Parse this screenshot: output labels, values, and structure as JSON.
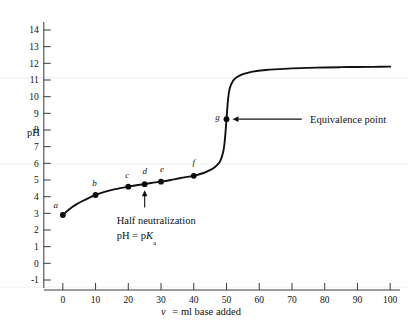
{
  "chart_data": {
    "type": "line",
    "title": "",
    "xlabel": "v = ml base added",
    "ylabel": "pH",
    "xlim": [
      -3,
      103
    ],
    "ylim": [
      -1.6,
      14.6
    ],
    "grid": false,
    "legend_position": "none",
    "x_ticks": [
      0,
      10,
      20,
      30,
      40,
      50,
      60,
      70,
      80,
      90,
      100
    ],
    "y_ticks": [
      -1,
      0,
      1,
      2,
      3,
      4,
      5,
      6,
      7,
      8,
      9,
      10,
      11,
      12,
      13,
      14
    ],
    "x_tick_labels": [
      "0",
      "10",
      "20",
      "30",
      "40",
      "50",
      "60",
      "70",
      "80",
      "90",
      "100"
    ],
    "y_tick_labels": [
      "-1",
      "0",
      "1",
      "2",
      "3",
      "4",
      "5",
      "6",
      "7",
      "8",
      "9",
      "10",
      "11",
      "12",
      "13",
      "14"
    ],
    "series": [
      {
        "name": "titration curve",
        "x": [
          0,
          2,
          4,
          6,
          8,
          10,
          13,
          16,
          20,
          23,
          25,
          27,
          30,
          33,
          36,
          40,
          43,
          45,
          46.5,
          48,
          49,
          49.5,
          50,
          50.5,
          51,
          52,
          53,
          55,
          58,
          62,
          66,
          70,
          75,
          80,
          85,
          90,
          95,
          100
        ],
        "y": [
          2.9,
          3.25,
          3.52,
          3.74,
          3.93,
          4.1,
          4.3,
          4.45,
          4.6,
          4.7,
          4.75,
          4.82,
          4.9,
          5.0,
          5.12,
          5.25,
          5.42,
          5.6,
          5.78,
          6.1,
          6.7,
          7.4,
          8.65,
          9.9,
          10.5,
          10.95,
          11.15,
          11.35,
          11.5,
          11.6,
          11.65,
          11.7,
          11.73,
          11.75,
          11.77,
          11.78,
          11.79,
          11.8
        ]
      }
    ],
    "points": [
      {
        "label": "a",
        "x": 0,
        "y": 2.9,
        "label_dx": -7,
        "label_dy": -7
      },
      {
        "label": "b",
        "x": 10,
        "y": 4.1,
        "label_dx": -1,
        "label_dy": -9
      },
      {
        "label": "c",
        "x": 20,
        "y": 4.6,
        "label_dx": -1,
        "label_dy": -9
      },
      {
        "label": "d",
        "x": 25,
        "y": 4.75,
        "label_dx": 0,
        "label_dy": -10
      },
      {
        "label": "e",
        "x": 30,
        "y": 4.9,
        "label_dx": 1,
        "label_dy": -10
      },
      {
        "label": "f",
        "x": 40,
        "y": 5.25,
        "label_dx": 0,
        "label_dy": -11
      },
      {
        "label": "g",
        "x": 50,
        "y": 8.65,
        "label_dx": -9,
        "label_dy": 1
      }
    ],
    "annotations": [
      {
        "id": "half-neutralization",
        "line1": "Half  neutralization",
        "line2_prefix": "pH  =  p",
        "line2_italic": "K",
        "line2_sub": "a",
        "target_x": 25,
        "target_y": 4.75,
        "arrow_from_y": 3.35,
        "text_x": 25,
        "text_y": 2.45
      },
      {
        "id": "equivalence-point",
        "text": "Equivalence point",
        "target_x": 50,
        "target_y": 8.65,
        "leader_to_x": 73,
        "text_x": 75.5,
        "text_y": 8.65
      }
    ]
  },
  "axes": {
    "y_axis_title": "pH",
    "x_axis_title_var": "v",
    "x_axis_title_rest": "=  ml  base  added"
  }
}
